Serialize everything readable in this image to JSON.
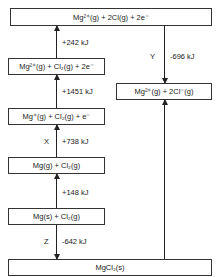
{
  "diagram": {
    "type": "Born-Haber cycle",
    "levels": [
      {
        "id": "top",
        "label": "Mg²⁺(g) + 2Cl(g) + 2e⁻"
      },
      {
        "id": "mg2plus",
        "label": "Mg²⁺(g) + Cl₂(g) + 2e⁻"
      },
      {
        "id": "mgplus",
        "label": "Mg⁺(g) + Cl₂(g) + e⁻"
      },
      {
        "id": "mg_gas",
        "label": "Mg(g) + Cl₂(g)"
      },
      {
        "id": "mg_solid",
        "label": "Mg(s) + Cl₂(g)"
      },
      {
        "id": "mgcl2",
        "label": "MgCl₂(s)"
      },
      {
        "id": "ions",
        "label": "Mg²⁺(g) + 2Cl⁻(g)"
      }
    ],
    "steps": [
      {
        "from": "mg2plus",
        "to": "top",
        "energy": "+242 kJ",
        "letter": ""
      },
      {
        "from": "mgplus",
        "to": "mg2plus",
        "energy": "+1451 kJ",
        "letter": ""
      },
      {
        "from": "mg_gas",
        "to": "mgplus",
        "energy": "+738 kJ",
        "letter": "X"
      },
      {
        "from": "mg_solid",
        "to": "mg_gas",
        "energy": "+148 kJ",
        "letter": ""
      },
      {
        "from": "mg_solid",
        "to": "mgcl2",
        "energy": "-642 kJ",
        "letter": "Z"
      },
      {
        "from": "top",
        "to": "ions",
        "energy": "-696 kJ",
        "letter": "Y"
      },
      {
        "from": "mgcl2",
        "to": "ions",
        "energy": "",
        "letter": ""
      }
    ]
  }
}
